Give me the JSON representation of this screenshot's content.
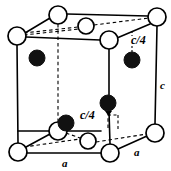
{
  "figure": {
    "kind": "crystal-unit-cell-diagram",
    "colors": {
      "line": "#000000",
      "open_atom_fill": "#ffffff",
      "filled_atom_fill": "#111111",
      "background": "#ffffff"
    },
    "labels": {
      "c_height": "c",
      "c_quarter_right": "c/4",
      "c_quarter_center": "c/4",
      "a_bottom": "a",
      "a_right": "a"
    },
    "atoms": {
      "open": [
        {
          "name": "atom-open-top-back-left",
          "x": 58,
          "y": 15,
          "r": 9
        },
        {
          "name": "atom-open-top-back-center",
          "x": 86,
          "y": 26,
          "r": 8
        },
        {
          "name": "atom-open-top-back-right",
          "x": 157,
          "y": 17,
          "r": 9
        },
        {
          "name": "atom-open-top-front-left",
          "x": 17,
          "y": 36,
          "r": 9
        },
        {
          "name": "atom-open-top-front-right",
          "x": 109,
          "y": 40,
          "r": 9
        },
        {
          "name": "atom-open-bottom-mid-left",
          "x": 58,
          "y": 131,
          "r": 9
        },
        {
          "name": "atom-open-bottom-back-center",
          "x": 88,
          "y": 141,
          "r": 8
        },
        {
          "name": "atom-open-bottom-back-right",
          "x": 155,
          "y": 133,
          "r": 9
        },
        {
          "name": "atom-open-bottom-front-left",
          "x": 18,
          "y": 152,
          "r": 9
        },
        {
          "name": "atom-open-bottom-front-right",
          "x": 110,
          "y": 153,
          "r": 9
        }
      ],
      "filled": [
        {
          "name": "atom-filled-upper-left",
          "x": 37,
          "y": 58,
          "r": 8
        },
        {
          "name": "atom-filled-upper-right",
          "x": 132,
          "y": 60,
          "r": 8
        },
        {
          "name": "atom-filled-center",
          "x": 108,
          "y": 103,
          "r": 8
        },
        {
          "name": "atom-filled-lower-left",
          "x": 66,
          "y": 123,
          "r": 8
        }
      ]
    },
    "label_positions": {
      "c_height": {
        "x": 160,
        "y": 80
      },
      "c_quarter_right": {
        "x": 131,
        "y": 34
      },
      "c_quarter_center": {
        "x": 80,
        "y": 109
      },
      "a_bottom": {
        "x": 62,
        "y": 158
      },
      "a_right": {
        "x": 134,
        "y": 148
      }
    }
  }
}
